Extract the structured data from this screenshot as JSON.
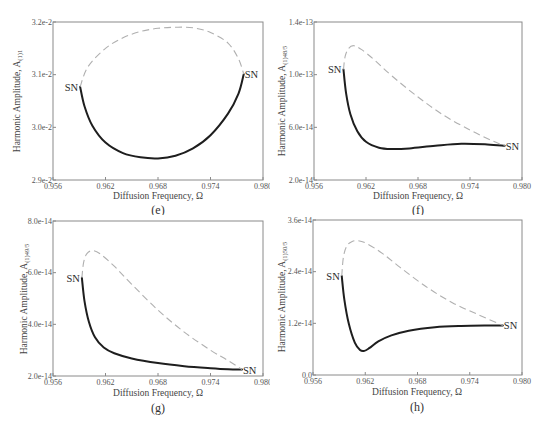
{
  "figure": {
    "panels": [
      "e",
      "f",
      "g",
      "h"
    ]
  },
  "chart_data": [
    {
      "id": "e",
      "type": "line",
      "caption": "(e)",
      "title": "",
      "xlabel": "Diffusion Frequency, Ω",
      "ylabel": "Harmonic Amplitude, A",
      "ylabel_subscript": "(1)1",
      "xlim": [
        0.956,
        0.98
      ],
      "ylim": [
        0.029,
        0.032
      ],
      "xticks": [
        "0.956",
        "0.962",
        "0.968",
        "0.974",
        "0.980"
      ],
      "yticks": [
        "2.9e-2",
        "3.0e-2",
        "3.1e-2",
        "3.2e-2"
      ],
      "ytick_values": [
        0.029,
        0.03,
        0.031,
        0.032
      ],
      "grid": false,
      "annotations": [
        {
          "text": "SN",
          "x": 0.9591,
          "y": 0.03077,
          "side": "left"
        },
        {
          "text": "SN",
          "x": 0.9778,
          "y": 0.03101,
          "side": "right"
        }
      ],
      "series": [
        {
          "name": "stable",
          "style": "solid",
          "x": [
            0.9591,
            0.9596,
            0.9605,
            0.962,
            0.964,
            0.966,
            0.968,
            0.97,
            0.972,
            0.974,
            0.976,
            0.9772,
            0.9778
          ],
          "y": [
            0.03077,
            0.0304,
            0.03003,
            0.02971,
            0.02951,
            0.02943,
            0.02941,
            0.02946,
            0.0296,
            0.02985,
            0.03026,
            0.03064,
            0.03101
          ]
        },
        {
          "name": "unstable",
          "style": "dashed",
          "x": [
            0.9591,
            0.96,
            0.962,
            0.964,
            0.966,
            0.968,
            0.97,
            0.972,
            0.974,
            0.976,
            0.9772,
            0.9778
          ],
          "y": [
            0.03077,
            0.03115,
            0.0315,
            0.0317,
            0.03182,
            0.03188,
            0.0319,
            0.03189,
            0.0318,
            0.0316,
            0.0313,
            0.03101
          ]
        }
      ]
    },
    {
      "id": "f",
      "type": "line",
      "caption": "(f)",
      "title": "",
      "xlabel": "Diffusion Frequency, Ω",
      "ylabel": "Harmonic Amplitude, A",
      "ylabel_subscript": "(1)48/5",
      "xlim": [
        0.956,
        0.98
      ],
      "ylim": [
        2e-14,
        1.4e-13
      ],
      "xticks": [
        "0.956",
        "0.962",
        "0.968",
        "0.974",
        "0.980"
      ],
      "yticks": [
        "2.0e-14",
        "6.0e-14",
        "1.0e-13",
        "1.4e-13"
      ],
      "ytick_values": [
        2e-14,
        6e-14,
        1e-13,
        1.4e-13
      ],
      "grid": false,
      "annotations": [
        {
          "text": "SN",
          "x": 0.9594,
          "y": 1.04e-13,
          "side": "left"
        },
        {
          "text": "SN",
          "x": 0.978,
          "y": 4.6e-14,
          "side": "right"
        }
      ],
      "series": [
        {
          "name": "stable",
          "style": "solid",
          "x": [
            0.9594,
            0.9597,
            0.9602,
            0.961,
            0.962,
            0.9635,
            0.965,
            0.967,
            0.97,
            0.973,
            0.976,
            0.978
          ],
          "y": [
            1.04e-13,
            8.6e-14,
            7e-14,
            5.7e-14,
            4.9e-14,
            4.45e-14,
            4.35e-14,
            4.4e-14,
            4.6e-14,
            4.75e-14,
            4.7e-14,
            4.6e-14
          ]
        },
        {
          "name": "unstable",
          "style": "dashed",
          "x": [
            0.9594,
            0.9596,
            0.96,
            0.9606,
            0.9615,
            0.963,
            0.965,
            0.968,
            0.971,
            0.974,
            0.9765,
            0.978
          ],
          "y": [
            1.04e-13,
            1.14e-13,
            1.2e-13,
            1.22e-13,
            1.19e-13,
            1.11e-13,
            9.9e-14,
            8.3e-14,
            6.9e-14,
            5.8e-14,
            5e-14,
            4.6e-14
          ]
        }
      ]
    },
    {
      "id": "g",
      "type": "line",
      "caption": "(g)",
      "title": "",
      "xlabel": "Diffusion Frequency, Ω",
      "ylabel": "Harmonic Amplitude, A",
      "ylabel_subscript": "(1)49/5",
      "xlim": [
        0.956,
        0.98
      ],
      "ylim": [
        2e-14,
        8e-14
      ],
      "xticks": [
        "0.956",
        "0.962",
        "0.968",
        "0.974",
        "0.980"
      ],
      "yticks": [
        "2.0e-14",
        "4.0e-14",
        "6.0e-14",
        "8.0e-14"
      ],
      "ytick_values": [
        2e-14,
        4e-14,
        6e-14,
        8e-14
      ],
      "grid": false,
      "annotations": [
        {
          "text": "SN",
          "x": 0.9593,
          "y": 5.8e-14,
          "side": "left"
        },
        {
          "text": "SN",
          "x": 0.9776,
          "y": 2.25e-14,
          "side": "right"
        }
      ],
      "series": [
        {
          "name": "stable",
          "style": "solid",
          "x": [
            0.9593,
            0.9596,
            0.9601,
            0.9608,
            0.9618,
            0.963,
            0.965,
            0.968,
            0.971,
            0.974,
            0.976,
            0.9776
          ],
          "y": [
            5.8e-14,
            4.9e-14,
            4.1e-14,
            3.5e-14,
            3.1e-14,
            2.88e-14,
            2.68e-14,
            2.5e-14,
            2.38e-14,
            2.3e-14,
            2.26e-14,
            2.25e-14
          ]
        },
        {
          "name": "unstable",
          "style": "dashed",
          "x": [
            0.9593,
            0.9595,
            0.9599,
            0.9606,
            0.9615,
            0.963,
            0.965,
            0.968,
            0.971,
            0.974,
            0.976,
            0.9776
          ],
          "y": [
            5.8e-14,
            6.4e-14,
            6.75e-14,
            6.85e-14,
            6.7e-14,
            6.25e-14,
            5.55e-14,
            4.55e-14,
            3.7e-14,
            3e-14,
            2.6e-14,
            2.25e-14
          ]
        }
      ]
    },
    {
      "id": "h",
      "type": "line",
      "caption": "(h)",
      "title": "",
      "xlabel": "Diffusion Frequency, Ω",
      "ylabel": "Harmonic Amplitude, A",
      "ylabel_subscript": "(1)50/5",
      "xlim": [
        0.956,
        0.98
      ],
      "ylim": [
        0.0,
        3.6e-14
      ],
      "xticks": [
        "0.956",
        "0.962",
        "0.968",
        "0.974",
        "0.980"
      ],
      "yticks": [
        "0.0",
        "1.2e-14",
        "2.4e-14",
        "3.6e-14"
      ],
      "ytick_values": [
        0.0,
        1.2e-14,
        2.4e-14,
        3.6e-14
      ],
      "grid": false,
      "annotations": [
        {
          "text": "SN",
          "x": 0.9593,
          "y": 2.3e-14,
          "side": "left"
        },
        {
          "text": "SN",
          "x": 0.9778,
          "y": 1.15e-14,
          "side": "right"
        }
      ],
      "series": [
        {
          "name": "stable",
          "style": "solid",
          "x": [
            0.9593,
            0.9596,
            0.9601,
            0.9608,
            0.9614,
            0.9619,
            0.9625,
            0.9635,
            0.965,
            0.967,
            0.97,
            0.973,
            0.976,
            0.9778
          ],
          "y": [
            2.3e-14,
            1.75e-14,
            1.2e-14,
            7.5e-15,
            5.8e-15,
            5.6e-15,
            6.3e-15,
            7.8e-15,
            9.2e-15,
            1.03e-14,
            1.11e-14,
            1.14e-14,
            1.15e-14,
            1.15e-14
          ]
        },
        {
          "name": "unstable",
          "style": "dashed",
          "x": [
            0.9593,
            0.9595,
            0.9599,
            0.9605,
            0.9612,
            0.9622,
            0.964,
            0.966,
            0.969,
            0.972,
            0.975,
            0.9778
          ],
          "y": [
            2.3e-14,
            2.75e-14,
            3e-14,
            3.1e-14,
            3.12e-14,
            3.05e-14,
            2.82e-14,
            2.5e-14,
            2.05e-14,
            1.68e-14,
            1.4e-14,
            1.15e-14
          ]
        }
      ]
    }
  ]
}
